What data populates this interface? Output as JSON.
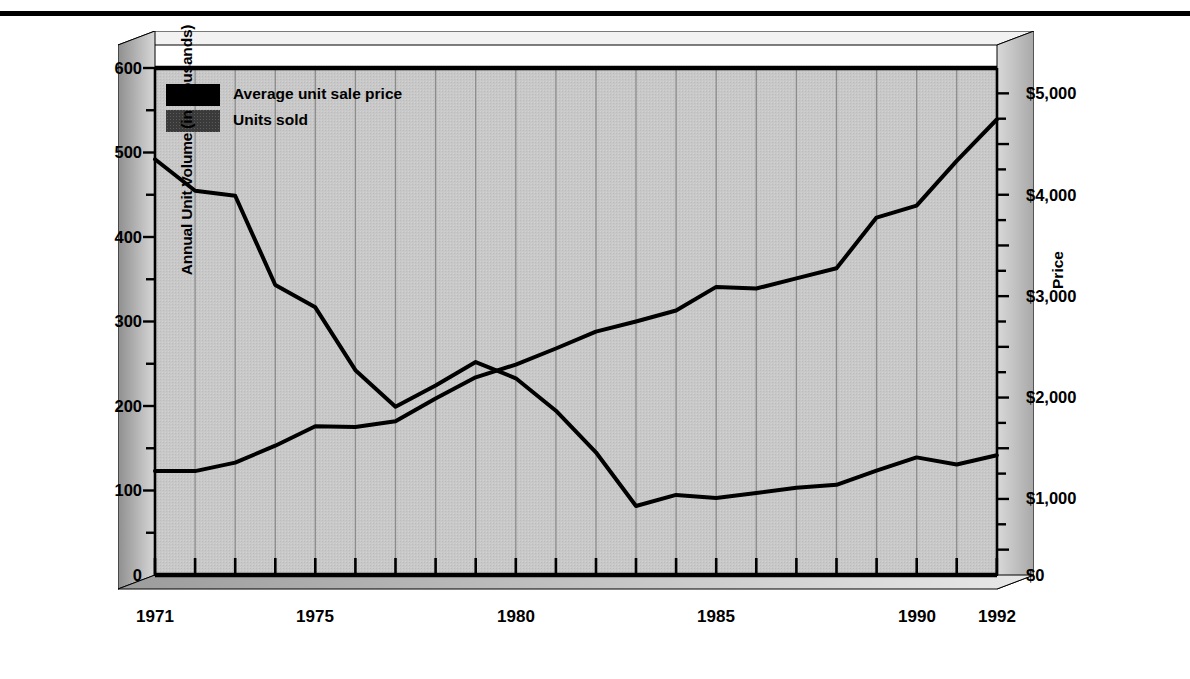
{
  "figure": {
    "title": "",
    "axis_left_label": "Annual Unit Volume (in thousands)",
    "axis_right_label": "Price",
    "legend": [
      {
        "label": "Average unit sale price",
        "swatch": "#000000",
        "series": "price"
      },
      {
        "label": "Units sold",
        "swatch": "#3a3a3a",
        "series": "units"
      }
    ],
    "y_left_ticks": [
      "0",
      "100",
      "200",
      "300",
      "400",
      "500",
      "600"
    ],
    "y_right_ticks": [
      "$0",
      "$1,000",
      "$2,000",
      "$3,000",
      "$4,000",
      "$5,000"
    ],
    "x_ticks": [
      "1971",
      "1975",
      "1980",
      "1985",
      "1990",
      "1992"
    ],
    "colors": {
      "plot_background": "#c6c6c6",
      "frame_light": "#e2e2e2",
      "frame_mid": "#b4b4b4",
      "frame_dark": "#9a9a9a",
      "gridline": "#8a8a8a",
      "line": "#000000",
      "rule": "#000000"
    }
  },
  "chart_data": {
    "type": "line",
    "title": "",
    "xlabel": "",
    "ylabel": "Annual Unit Volume (in thousands)",
    "y2label": "Price",
    "xlim": [
      1971,
      1992
    ],
    "ylim": [
      0,
      600
    ],
    "y2lim": [
      0,
      5000
    ],
    "grid": "vertical",
    "legend_position": "top-left-inside",
    "x": [
      1971,
      1972,
      1973,
      1974,
      1975,
      1976,
      1977,
      1978,
      1979,
      1980,
      1981,
      1982,
      1983,
      1984,
      1985,
      1986,
      1987,
      1988,
      1989,
      1990,
      1991,
      1992
    ],
    "series": [
      {
        "name": "Average unit sale price",
        "axis": "right",
        "unit": "$",
        "values": [
          4100,
          3790,
          3740,
          2860,
          2640,
          2020,
          1660,
          1870,
          2100,
          1940,
          1620,
          1210,
          680,
          790,
          760,
          810,
          860,
          890,
          1030,
          1160,
          1090,
          1180
        ]
      },
      {
        "name": "Units sold",
        "axis": "left",
        "unit": "thousands",
        "values": [
          123,
          123,
          133,
          153,
          176,
          175,
          182,
          209,
          234,
          249,
          268,
          288,
          300,
          313,
          341,
          339,
          351,
          363,
          423,
          437,
          490,
          539
        ]
      }
    ]
  }
}
